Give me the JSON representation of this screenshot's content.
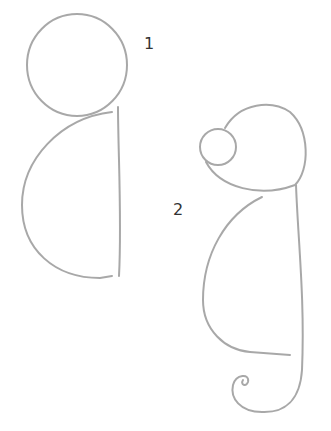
{
  "steps": [
    {
      "number": "1",
      "description": "Circle head with half-oval body"
    },
    {
      "number": "2",
      "description": "Head with small eye circle, body, and curled tail"
    }
  ],
  "colors": {
    "pencil": "#9a9a9a",
    "background": "#ffffff",
    "label": "#333333"
  }
}
